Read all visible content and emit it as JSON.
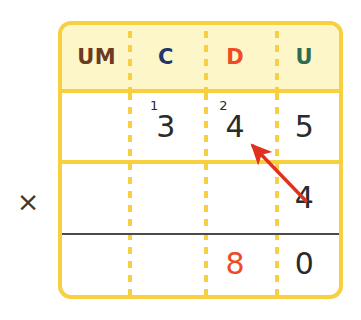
{
  "worksheet": {
    "operator_symbol": "×",
    "operator_name": "multiplication-sign"
  },
  "table": {
    "headers": [
      {
        "label": "UM",
        "color": "#6b3a21",
        "name": "header-um"
      },
      {
        "label": "C",
        "color": "#23356b",
        "name": "header-c"
      },
      {
        "label": "D",
        "color": "#ef4a27",
        "name": "header-d"
      },
      {
        "label": "U",
        "color": "#2f6b4f",
        "name": "header-u"
      }
    ],
    "rows": [
      {
        "name": "multiplicand-row",
        "cells": [
          {
            "value": "",
            "carry": "",
            "color": "#2b2b2b"
          },
          {
            "value": "3",
            "carry": "1",
            "color": "#2b2b2b"
          },
          {
            "value": "4",
            "carry": "2",
            "color": "#2b2b2b"
          },
          {
            "value": "5",
            "carry": "",
            "color": "#2b2b2b"
          }
        ]
      },
      {
        "name": "multiplier-row",
        "cells": [
          {
            "value": "",
            "carry": "",
            "color": "#2b2b2b"
          },
          {
            "value": "",
            "carry": "",
            "color": "#2b2b2b"
          },
          {
            "value": "",
            "carry": "",
            "color": "#2b2b2b"
          },
          {
            "value": "4",
            "carry": "",
            "color": "#2b2b2b"
          }
        ]
      },
      {
        "name": "result-row",
        "cells": [
          {
            "value": "",
            "carry": "",
            "color": "#2b2b2b"
          },
          {
            "value": "",
            "carry": "",
            "color": "#2b2b2b"
          },
          {
            "value": "8",
            "carry": "",
            "color": "#ef4a27"
          },
          {
            "value": "0",
            "carry": "",
            "color": "#2b2b2b"
          }
        ]
      }
    ]
  },
  "annotation": {
    "arrow_name": "red-arrow-multiplier-to-digit",
    "arrow_color": "#e0301e",
    "from_x": 306,
    "from_y": 201,
    "to_x": 250,
    "to_y": 143
  },
  "colors": {
    "table_border": "#f7cf3f",
    "header_fill": "#fcf6c8",
    "answer_line": "#4a4a4a",
    "accent_red": "#ef4a27",
    "page_background": "#ffffff"
  }
}
